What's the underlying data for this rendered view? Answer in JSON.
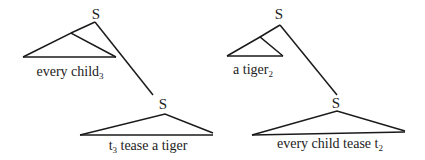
{
  "colors": {
    "ink": "#1a1a1a",
    "background": "#ffffff"
  },
  "trees": [
    {
      "root_label": "S",
      "moved_phrase": {
        "text": "every child",
        "subscript": "3"
      },
      "lower_node_label": "S",
      "lower_phrase": {
        "trace": "t",
        "trace_subscript": "3",
        "text": " tease a tiger"
      }
    },
    {
      "root_label": "S",
      "moved_phrase": {
        "text": "a tiger",
        "subscript": "2"
      },
      "lower_node_label": "S",
      "lower_phrase": {
        "text": "every child tease ",
        "trace": "t",
        "trace_subscript": "2"
      }
    }
  ]
}
